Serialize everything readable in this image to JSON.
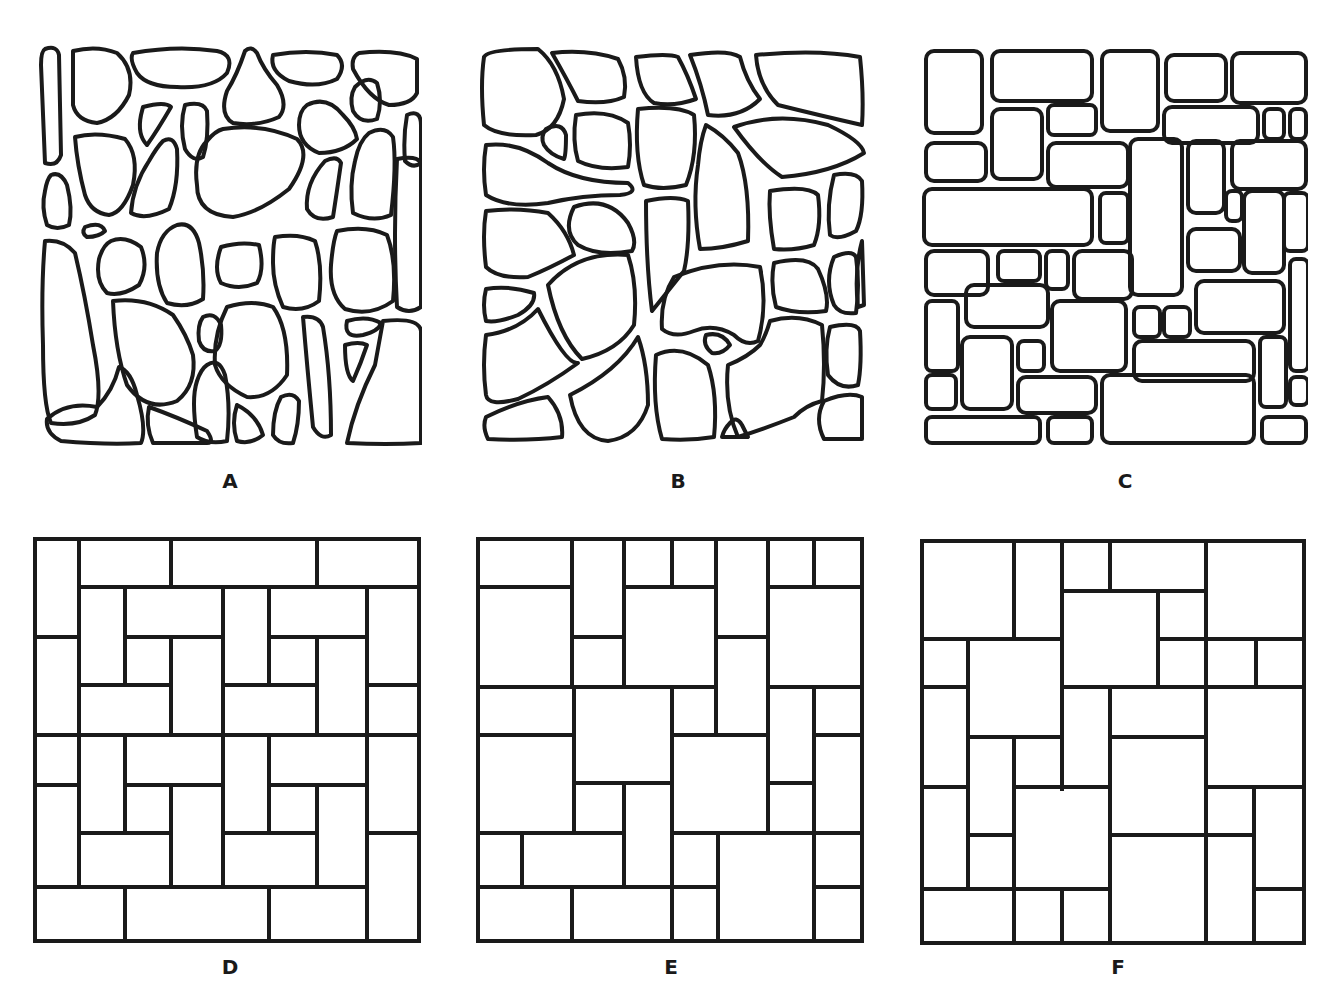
{
  "figure": {
    "stroke_color": "#1a1a1a",
    "background_color": "#ffffff",
    "panels": [
      {
        "id": "A",
        "label": "A",
        "pattern": "random rubble (irregular rounded stones)"
      },
      {
        "id": "B",
        "label": "B",
        "pattern": "flagstone (irregular polygonal stones, tight joints)"
      },
      {
        "id": "C",
        "label": "C",
        "pattern": "ashlar (rounded rectangular cut stones)"
      },
      {
        "id": "D",
        "label": "D",
        "pattern": "basket-weave rectangular pavers"
      },
      {
        "id": "E",
        "label": "E",
        "pattern": "random rectangular pavers"
      },
      {
        "id": "F",
        "label": "F",
        "pattern": "random rectangular pavers (variant)"
      }
    ]
  }
}
